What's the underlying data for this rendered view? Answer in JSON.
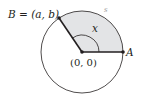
{
  "diagram": {
    "point_b_label": "B = (a, b)",
    "point_a_label": "A",
    "origin_label": "(0, 0)",
    "angle_label": "x",
    "arc_label": "s",
    "colors": {
      "sector_fill": "#e3e4e6",
      "stroke": "#231f20",
      "arc_label": "#9a9a9a"
    }
  }
}
